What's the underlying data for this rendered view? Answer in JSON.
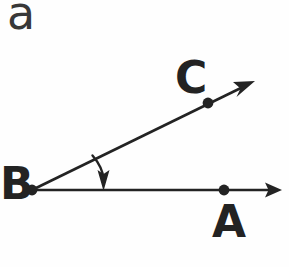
{
  "figure": {
    "part_label": "a",
    "background_color": "#fefefe",
    "stroke_color": "#232323",
    "labels": {
      "vertex_b": "B",
      "point_a": "A",
      "point_c": "C"
    },
    "points": [
      {
        "name": "B",
        "label": "B",
        "x": 32,
        "y": 190,
        "role": "vertex"
      },
      {
        "name": "A",
        "label": "A",
        "x": 224,
        "y": 190,
        "role": "ray-point"
      },
      {
        "name": "C",
        "label": "C",
        "x": 208,
        "y": 103,
        "role": "ray-point"
      }
    ],
    "rays": [
      {
        "name": "ray-ba",
        "from_x": 32,
        "from_y": 190,
        "to_x": 282,
        "to_y": 190,
        "arrow": "end"
      },
      {
        "name": "ray-bc",
        "from_x": 32,
        "from_y": 190,
        "to_x": 255,
        "to_y": 81,
        "arrow": "end"
      }
    ],
    "angle_marker": {
      "name": "angle-arc",
      "start_x": 92,
      "start_y": 156,
      "end_x": 103,
      "end_y": 182,
      "arrow": "end",
      "arrow_direction": "down"
    }
  }
}
